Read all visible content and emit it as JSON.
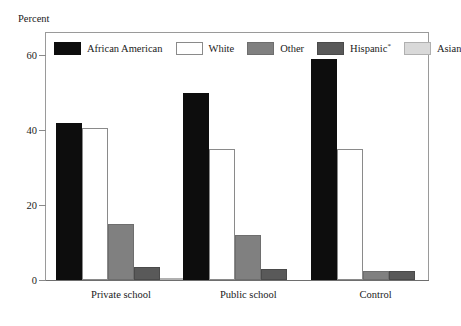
{
  "chart_data": {
    "type": "bar",
    "title": "",
    "subtitle": "",
    "xlabel": "",
    "ylabel": "Percent",
    "ylim": [
      0,
      66
    ],
    "yticks": [
      0,
      20,
      40,
      60
    ],
    "ytick_labels": [
      "0",
      "20",
      "40",
      "60"
    ],
    "grid": false,
    "legend_position": "top-left-inside",
    "categories": [
      "Private school",
      "Public school",
      "Control"
    ],
    "series": [
      {
        "name": "African American",
        "color": "#0d0d0d",
        "values": [
          42,
          50,
          59
        ]
      },
      {
        "name": "White",
        "color": "#ffffff",
        "values": [
          40.5,
          35,
          35
        ]
      },
      {
        "name": "Other",
        "color": "#808080",
        "values": [
          15,
          12,
          2.5
        ]
      },
      {
        "name": "Hispanic",
        "color": "#595959",
        "values": [
          3.5,
          3,
          2.5
        ]
      },
      {
        "name": "Asian",
        "color": "#d9d9d9",
        "values": [
          0.5,
          0,
          0
        ]
      }
    ],
    "annotations": {
      "hispanic_footnote_marker": "*"
    }
  },
  "legend": {
    "items": [
      {
        "label": "African American",
        "swatch_class": "fill-african-american",
        "marker": ""
      },
      {
        "label": "White",
        "swatch_class": "fill-white",
        "marker": ""
      },
      {
        "label": "Other",
        "swatch_class": "fill-other",
        "marker": ""
      },
      {
        "label": "Hispanic",
        "swatch_class": "fill-hispanic",
        "marker": "*"
      },
      {
        "label": "Asian",
        "swatch_class": "fill-asian",
        "marker": ""
      }
    ]
  },
  "axis": {
    "y_title": "Percent"
  }
}
